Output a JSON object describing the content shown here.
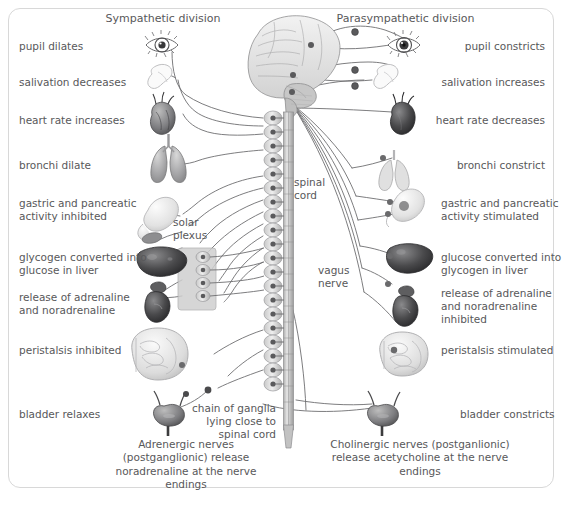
{
  "figure": {
    "title_left": "Sympathetic division",
    "title_right": "Parasympathetic division"
  },
  "left_labels": [
    {
      "id": "pupil",
      "text": "pupil dilates"
    },
    {
      "id": "salivation",
      "text": "salivation decreases"
    },
    {
      "id": "heart",
      "text": "heart rate increases"
    },
    {
      "id": "bronchi",
      "text": "bronchi dilate"
    },
    {
      "id": "gastric",
      "text": "gastric and pancreatic\nactivity inhibited"
    },
    {
      "id": "liver",
      "text": "glycogen converted into\nglucose in liver"
    },
    {
      "id": "adrenal",
      "text": "release of adrenaline\nand noradrenaline"
    },
    {
      "id": "peristalsis",
      "text": "peristalsis inhibited"
    },
    {
      "id": "bladder",
      "text": "bladder relaxes"
    }
  ],
  "right_labels": [
    {
      "id": "pupil",
      "text": "pupil constricts"
    },
    {
      "id": "salivation",
      "text": "salivation increases"
    },
    {
      "id": "heart",
      "text": "heart rate decreases"
    },
    {
      "id": "bronchi",
      "text": "bronchi constrict"
    },
    {
      "id": "gastric",
      "text": "gastric and pancreatic\nactivity stimulated"
    },
    {
      "id": "liver",
      "text": "glucose converted into\nglycogen in liver"
    },
    {
      "id": "adrenal",
      "text": "release of adrenaline\nand noradrenaline\ninhibited"
    },
    {
      "id": "peristalsis",
      "text": "peristalsis stimulated"
    },
    {
      "id": "bladder",
      "text": "bladder constricts"
    }
  ],
  "inner_labels": {
    "spinal_cord": "spinal\ncord",
    "solar_plexus": "solar\nplexus",
    "vagus_nerve": "vagus\nnerve",
    "chain_of_ganglia": "chain of ganglia\nlying close to\nspinal cord"
  },
  "captions": {
    "left": "Adrenergic nerves\n(postganglionic)\nrelease noradrenaline\nat the nerve endings",
    "right": "Cholinergic nerves\n(postganlionic)\nrelease acetycholine\nat the nerve endings"
  },
  "organs": {
    "left": [
      "eye-icon",
      "salivary-gland-icon",
      "heart-icon",
      "lungs-icon",
      "stomach-pancreas-icon",
      "liver-icon",
      "adrenal-kidney-icon",
      "intestines-icon",
      "bladder-icon"
    ],
    "right": [
      "eye-icon",
      "salivary-gland-icon",
      "heart-icon",
      "lungs-icon",
      "stomach-pancreas-icon",
      "liver-icon",
      "adrenal-kidney-icon",
      "intestines-icon",
      "bladder-icon"
    ],
    "center": [
      "brain-icon",
      "spinal-cord-icon",
      "ganglion-chain-icon",
      "solar-plexus-icon"
    ]
  },
  "colors": {
    "text": "#58585a",
    "line": "#6e6e70",
    "frame": "#d8d8d8",
    "organ_dark": "#4a4a4c",
    "organ_light": "#cfcfcf",
    "ganglion": "#b9b9b9",
    "cord": "#c9c9c9"
  }
}
